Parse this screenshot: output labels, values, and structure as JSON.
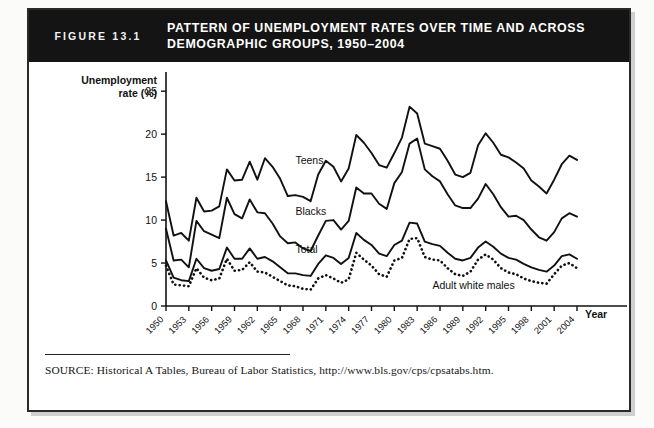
{
  "figure": {
    "number_label": "FIGURE 13.1",
    "title_line1": "PATTERN OF UNEMPLOYMENT RATES OVER TIME AND ACROSS",
    "title_line2": "DEMOGRAPHIC GROUPS, 1950–2004",
    "source": "SOURCE: Historical A Tables, Bureau of Labor Statistics, http://www.bls.gov/cps/cpsatabs.htm.",
    "header_bg": "#141414",
    "header_fg": "#ffffff",
    "ink": "#111111",
    "page_bg": "#ffffff"
  },
  "chart_data": {
    "type": "line",
    "title": "Pattern of Unemployment Rates over Time and across Demographic Groups, 1950–2004",
    "xlabel": "Year",
    "ylabel": "Unemployment rate (%)",
    "xlim": [
      1950,
      2004
    ],
    "ylim": [
      0,
      27
    ],
    "yticks": [
      0,
      5,
      10,
      15,
      20,
      25
    ],
    "ytick_labels": [
      "0",
      "5",
      "10",
      "15",
      "20",
      "25"
    ],
    "xticks": [
      1950,
      1953,
      1956,
      1959,
      1962,
      1965,
      1968,
      1971,
      1974,
      1977,
      1980,
      1983,
      1986,
      1989,
      1992,
      1995,
      1998,
      2001,
      2004
    ],
    "xtick_labels": [
      "1950",
      "1953",
      "1956",
      "1959",
      "1962",
      "1965",
      "1968",
      "1971",
      "1974",
      "1977",
      "1980",
      "1983",
      "1986",
      "1989",
      "1992",
      "1995",
      "1998",
      "2001",
      "2004"
    ],
    "grid": false,
    "legend": "inline-labels",
    "x": [
      1950,
      1951,
      1952,
      1953,
      1954,
      1955,
      1956,
      1957,
      1958,
      1959,
      1960,
      1961,
      1962,
      1963,
      1964,
      1965,
      1966,
      1967,
      1968,
      1969,
      1970,
      1971,
      1972,
      1973,
      1974,
      1975,
      1976,
      1977,
      1978,
      1979,
      1980,
      1981,
      1982,
      1983,
      1984,
      1985,
      1986,
      1987,
      1988,
      1989,
      1990,
      1991,
      1992,
      1993,
      1994,
      1995,
      1996,
      1997,
      1998,
      1999,
      2000,
      2001,
      2002,
      2003,
      2004
    ],
    "series": [
      {
        "name": "Teens",
        "label": "Teens",
        "style": "solid",
        "label_x": 1967,
        "label_y": 16.5,
        "values": [
          12.2,
          8.2,
          8.5,
          7.6,
          12.6,
          11.0,
          11.1,
          11.6,
          15.9,
          14.6,
          14.7,
          16.8,
          14.7,
          17.2,
          16.2,
          14.8,
          12.8,
          12.9,
          12.7,
          12.2,
          15.3,
          16.9,
          16.2,
          14.5,
          16.0,
          19.9,
          19.0,
          17.8,
          16.4,
          16.1,
          17.8,
          19.6,
          23.2,
          22.4,
          18.9,
          18.6,
          18.3,
          16.9,
          15.3,
          15.0,
          15.5,
          18.7,
          20.1,
          19.0,
          17.6,
          17.3,
          16.7,
          16.0,
          14.6,
          13.9,
          13.1,
          14.7,
          16.5,
          17.5,
          17.0
        ]
      },
      {
        "name": "Blacks",
        "label": "Blacks",
        "style": "solid",
        "label_x": 1967,
        "label_y": 10.6,
        "values": [
          9.0,
          5.3,
          5.4,
          4.5,
          9.9,
          8.7,
          8.3,
          7.9,
          12.6,
          10.7,
          10.2,
          12.4,
          10.9,
          10.8,
          9.6,
          8.1,
          7.3,
          7.4,
          6.7,
          6.4,
          8.2,
          9.9,
          10.0,
          8.9,
          9.9,
          13.8,
          13.1,
          13.1,
          11.9,
          11.3,
          14.3,
          15.6,
          18.9,
          19.5,
          15.9,
          15.1,
          14.5,
          13.0,
          11.7,
          11.4,
          11.4,
          12.5,
          14.2,
          13.0,
          11.5,
          10.4,
          10.5,
          10.0,
          8.9,
          8.0,
          7.6,
          8.6,
          10.2,
          10.8,
          10.4
        ]
      },
      {
        "name": "Total",
        "label": "Total",
        "style": "solid",
        "label_x": 1967,
        "label_y": 6.2,
        "values": [
          5.3,
          3.3,
          3.0,
          2.9,
          5.5,
          4.4,
          4.1,
          4.3,
          6.8,
          5.5,
          5.5,
          6.7,
          5.5,
          5.7,
          5.2,
          4.5,
          3.8,
          3.8,
          3.6,
          3.5,
          4.9,
          5.9,
          5.6,
          4.9,
          5.6,
          8.5,
          7.7,
          7.1,
          6.1,
          5.8,
          7.1,
          7.6,
          9.7,
          9.6,
          7.5,
          7.2,
          7.0,
          6.2,
          5.5,
          5.3,
          5.6,
          6.8,
          7.5,
          6.9,
          6.1,
          5.6,
          5.4,
          4.9,
          4.5,
          4.2,
          4.0,
          4.7,
          5.8,
          6.0,
          5.5
        ]
      },
      {
        "name": "Adult white males",
        "label": "Adult white males",
        "style": "dotted",
        "label_x": 1985,
        "label_y": 2.0,
        "values": [
          4.7,
          2.5,
          2.4,
          2.3,
          4.4,
          3.3,
          3.0,
          3.2,
          5.5,
          4.1,
          4.2,
          5.1,
          4.0,
          3.9,
          3.4,
          2.9,
          2.4,
          2.3,
          2.0,
          1.9,
          3.2,
          3.6,
          3.2,
          2.7,
          3.1,
          6.2,
          5.4,
          4.7,
          3.7,
          3.4,
          5.3,
          5.6,
          7.8,
          7.9,
          5.7,
          5.4,
          5.3,
          4.4,
          3.7,
          3.5,
          4.0,
          5.4,
          6.0,
          5.4,
          4.4,
          3.9,
          3.7,
          3.2,
          2.9,
          2.7,
          2.6,
          3.7,
          4.7,
          5.0,
          4.4
        ]
      }
    ]
  }
}
